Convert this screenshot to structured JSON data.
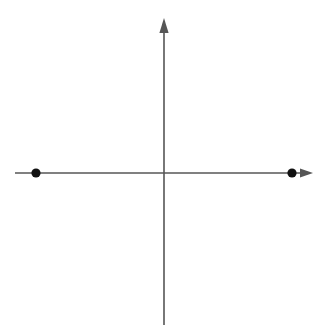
{
  "figure": {
    "width": 328,
    "height": 332,
    "background_color": "#ffffff",
    "caption": ""
  },
  "chart_data": {
    "type": "scatter",
    "title": "",
    "subtitle": "",
    "xlabel": "",
    "ylabel": "",
    "grid": false,
    "legend": null,
    "axis_style": {
      "line_color": "#565656",
      "line_width_px": 1.6,
      "arrowheads": [
        "x-positive",
        "y-positive"
      ],
      "ticks": false,
      "tick_labels": false
    },
    "origin_px": {
      "x": 164,
      "y": 173
    },
    "x_axis": {
      "start_px": 15,
      "end_px": 313,
      "arrow_tip_px": 313,
      "arrow_base_px": 300,
      "y_px": 173
    },
    "y_axis": {
      "start_px": 325,
      "end_px": 18,
      "arrow_tip_px": 18,
      "arrow_base_px": 33,
      "x_px": 164
    },
    "point_color": "#111111",
    "point_radius_px": 4.6,
    "points": [
      {
        "label": "",
        "x_px": 36,
        "y_px": 173,
        "on_axis": "x",
        "side": "negative"
      },
      {
        "label": "",
        "x_px": 292,
        "y_px": 173,
        "on_axis": "x",
        "side": "positive"
      }
    ],
    "x": [
      -128,
      128
    ],
    "y": [
      0,
      0
    ],
    "xlim": [
      -149,
      149
    ],
    "ylim": [
      -152,
      155
    ],
    "annotations": []
  },
  "icons": {
    "x_arrowhead": "arrow-right-icon",
    "y_arrowhead": "arrow-up-icon",
    "point_marker": "filled-circle-icon"
  }
}
